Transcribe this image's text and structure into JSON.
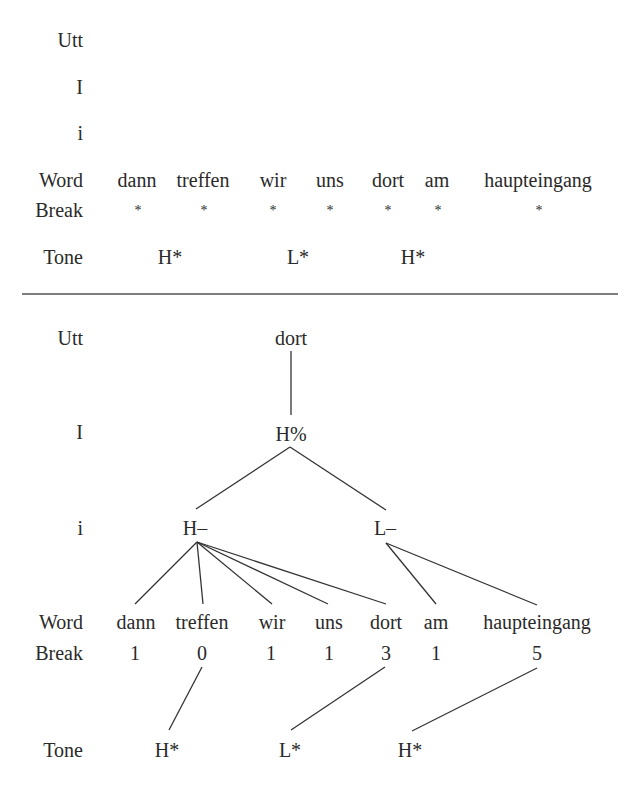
{
  "tier_labels": {
    "utt": "Utt",
    "intonation_phrase": "I",
    "intermediate_phrase": "i",
    "word": "Word",
    "break": "Break",
    "tone": "Tone"
  },
  "words": [
    "dann",
    "treffen",
    "wir",
    "uns",
    "dort",
    "am",
    "haupteingang"
  ],
  "top_panel": {
    "break_marks": [
      "*",
      "*",
      "*",
      "*",
      "*",
      "*",
      "*"
    ],
    "tones": [
      "H*",
      "L*",
      "H*"
    ]
  },
  "bottom_panel": {
    "utt_node": "dort",
    "intonation_phrase_node": "H%",
    "intermediate_phrase_nodes": [
      "H–",
      "L–"
    ],
    "break_indices": [
      "1",
      "0",
      "1",
      "1",
      "3",
      "1",
      "5"
    ],
    "tones": [
      "H*",
      "L*",
      "H*"
    ]
  }
}
